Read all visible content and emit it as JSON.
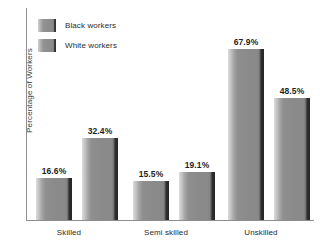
{
  "chart_data": {
    "type": "bar",
    "title": "",
    "xlabel": "",
    "ylabel": "Percentage of Workers",
    "categories": [
      "Skilled",
      "Semi skilled",
      "Unskilled"
    ],
    "series": [
      {
        "name": "Black workers",
        "values": [
          16.6,
          15.5,
          67.9
        ],
        "labels": [
          "16.6%",
          "15.5%",
          "67.9%"
        ],
        "color": "#8a8a8a"
      },
      {
        "name": "White workers",
        "values": [
          32.4,
          19.1,
          48.5
        ],
        "labels": [
          "32.4%",
          "19.1%",
          "48.5%"
        ],
        "color": "#8a8a8a"
      }
    ],
    "ylim": [
      0,
      84
    ],
    "grid": false,
    "legend_position": "top-left",
    "axis_color": "#8e8e8e"
  },
  "legend": {
    "items": [
      {
        "label": "Black workers"
      },
      {
        "label": "White workers"
      }
    ]
  },
  "axes": {
    "y_title": "Percentage of Workers",
    "categories": [
      {
        "label": "Skilled"
      },
      {
        "label": "Semi skilled"
      },
      {
        "label": "Unskilled"
      }
    ]
  },
  "bars": [
    {
      "label": "16.6%",
      "value": 16.6,
      "series": "Black workers",
      "category": "Skilled"
    },
    {
      "label": "32.4%",
      "value": 32.4,
      "series": "White workers",
      "category": "Skilled"
    },
    {
      "label": "15.5%",
      "value": 15.5,
      "series": "Black workers",
      "category": "Semi skilled"
    },
    {
      "label": "19.1%",
      "value": 19.1,
      "series": "White workers",
      "category": "Semi skilled"
    },
    {
      "label": "67.9%",
      "value": 67.9,
      "series": "Black workers",
      "category": "Unskilled"
    },
    {
      "label": "48.5%",
      "value": 48.5,
      "series": "White workers",
      "category": "Unskilled"
    }
  ]
}
